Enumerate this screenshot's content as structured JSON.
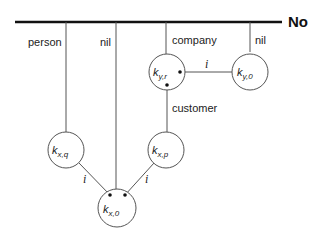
{
  "diagram": {
    "bar_label": "No",
    "colors": {
      "stroke": "#555555",
      "bar": "#111111",
      "text": "#222222",
      "fill": "#ffffff"
    },
    "branch_labels": {
      "person": "person",
      "nil_left": "nil",
      "company": "company",
      "nil_right": "nil",
      "customer": "customer"
    },
    "edge_labels": {
      "yr_y0": "i",
      "xq_x0": "i",
      "xp_x0": "i"
    },
    "nodes": {
      "k_yr": {
        "base": "k",
        "sub": "y,r"
      },
      "k_y0": {
        "base": "k",
        "sub": "y,0"
      },
      "k_xq": {
        "base": "k",
        "sub": "x,q"
      },
      "k_xp": {
        "base": "k",
        "sub": "x,p"
      },
      "k_x0": {
        "base": "k",
        "sub": "x,0"
      }
    }
  }
}
